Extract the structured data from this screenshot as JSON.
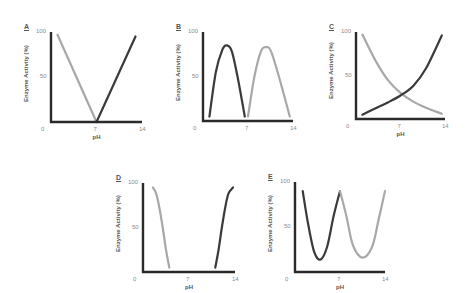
{
  "colors": {
    "dark": "#3a3a3a",
    "light": "#a8a8a8",
    "axis": "#2a2a2a",
    "tick": "#8a8a8a"
  },
  "chart_data": [
    {
      "panel": "A",
      "type": "line",
      "xlabel": "pH",
      "ylabel": "Enzyme Activity (%)",
      "xticks": [
        "0",
        "7",
        "14"
      ],
      "yticks": [
        "50",
        "100"
      ],
      "xlim": [
        0,
        14
      ],
      "ylim": [
        0,
        100
      ],
      "series": [
        {
          "name": "light",
          "color": "light",
          "x": [
            1,
            7
          ],
          "y": [
            97,
            0
          ]
        },
        {
          "name": "dark",
          "color": "dark",
          "x": [
            7,
            13
          ],
          "y": [
            0,
            95
          ]
        }
      ]
    },
    {
      "panel": "B",
      "type": "line",
      "xlabel": "",
      "ylabel": "Enzyme Activity (%)",
      "xticks": [
        "0",
        "7",
        "14"
      ],
      "yticks": [
        "50",
        "100"
      ],
      "xlim": [
        0,
        14
      ],
      "ylim": [
        0,
        100
      ],
      "series": [
        {
          "name": "dark",
          "color": "dark",
          "x": [
            1,
            2,
            3,
            3.7,
            4.5,
            5.5,
            6.5
          ],
          "y": [
            5,
            55,
            80,
            85,
            78,
            45,
            5
          ]
        },
        {
          "name": "light",
          "color": "light",
          "x": [
            7,
            8,
            9,
            9.8,
            10.6,
            12,
            13.5
          ],
          "y": [
            5,
            50,
            78,
            83,
            78,
            45,
            5
          ]
        }
      ]
    },
    {
      "panel": "C",
      "type": "line",
      "xlabel": "pH",
      "ylabel": "Enzyme Activity (%)",
      "xticks": [
        "0",
        "7",
        "14"
      ],
      "yticks": [
        "50",
        "100"
      ],
      "xlim": [
        0,
        14
      ],
      "ylim": [
        0,
        100
      ],
      "series": [
        {
          "name": "light",
          "color": "light",
          "x": [
            1,
            3,
            5,
            7,
            9,
            11,
            13.5
          ],
          "y": [
            97,
            68,
            45,
            30,
            20,
            13,
            6
          ]
        },
        {
          "name": "dark",
          "color": "dark",
          "x": [
            1,
            3,
            5,
            7,
            9,
            11,
            13.5
          ],
          "y": [
            5,
            12,
            19,
            27,
            38,
            58,
            96
          ]
        }
      ]
    },
    {
      "panel": "D",
      "type": "line",
      "xlabel": "pH",
      "ylabel": "Enzyme Activity (%)",
      "xticks": [
        "0",
        "7",
        "14"
      ],
      "yticks": [
        "50",
        "100"
      ],
      "xlim": [
        0,
        14
      ],
      "ylim": [
        0,
        100
      ],
      "series": [
        {
          "name": "light",
          "color": "light",
          "x": [
            1.5,
            2,
            2.5,
            3,
            3.5,
            4
          ],
          "y": [
            95,
            88,
            72,
            50,
            25,
            5
          ]
        },
        {
          "name": "dark",
          "color": "dark",
          "x": [
            11,
            11.5,
            12,
            12.5,
            13,
            13.7
          ],
          "y": [
            5,
            25,
            50,
            72,
            88,
            95
          ]
        }
      ]
    },
    {
      "panel": "E",
      "type": "line",
      "xlabel": "pH",
      "ylabel": "Enzyme Activity (%)",
      "xticks": [
        "0",
        "7",
        "14"
      ],
      "yticks": [
        "50",
        "100"
      ],
      "xlim": [
        0,
        14
      ],
      "ylim": [
        0,
        100
      ],
      "series": [
        {
          "name": "dark",
          "color": "dark",
          "x": [
            1.2,
            2,
            3,
            4,
            5,
            6,
            7
          ],
          "y": [
            90,
            55,
            22,
            14,
            28,
            62,
            90
          ]
        },
        {
          "name": "light",
          "color": "light",
          "x": [
            7,
            8,
            9,
            10.5,
            12,
            13,
            14
          ],
          "y": [
            90,
            62,
            30,
            16,
            28,
            58,
            90
          ]
        }
      ]
    }
  ],
  "panels": [
    {
      "letter": "A",
      "x": 51,
      "y": 32,
      "w": 91,
      "h": 90
    },
    {
      "letter": "B",
      "x": 203,
      "y": 32,
      "w": 90,
      "h": 89
    },
    {
      "letter": "C",
      "x": 356,
      "y": 32,
      "w": 89,
      "h": 87
    },
    {
      "letter": "D",
      "x": 143,
      "y": 183,
      "w": 92,
      "h": 89
    },
    {
      "letter": "E",
      "x": 295,
      "y": 182,
      "w": 90,
      "h": 90
    }
  ]
}
